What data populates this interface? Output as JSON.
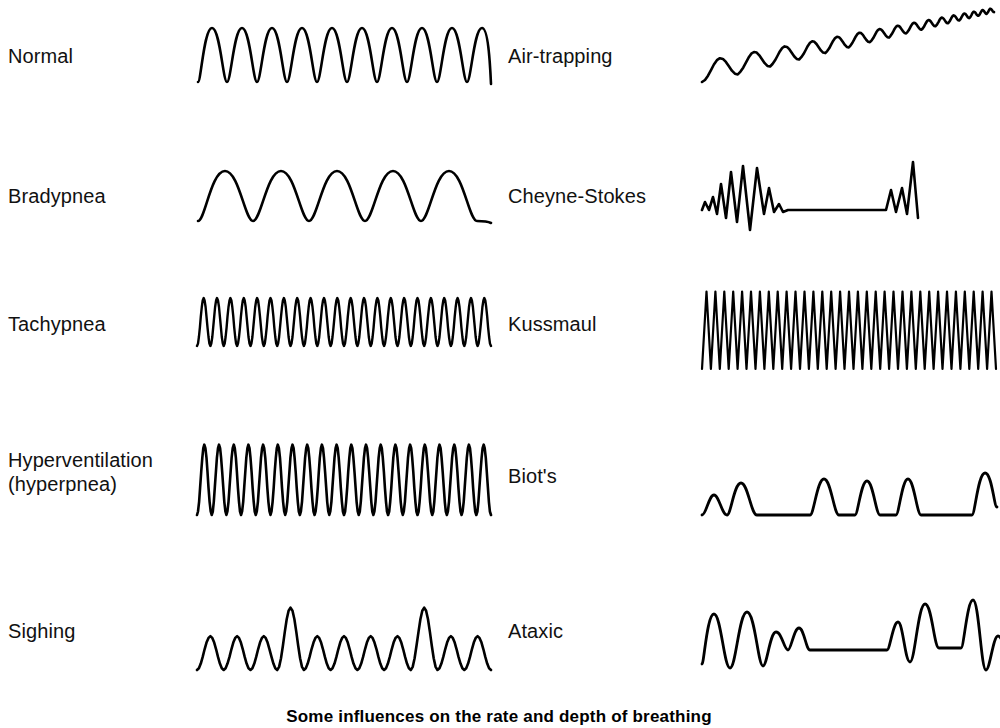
{
  "figure": {
    "caption": "Some influences on the rate and depth of breathing",
    "stroke_color": "#000000",
    "background_color": "#ffffff"
  },
  "columns": [
    {
      "name": "left-column",
      "patterns": [
        {
          "id": "normal",
          "label": "Normal",
          "waveform": "regular-sine",
          "description": "Regular rate and depth",
          "cycles": 10,
          "amplitude": 28,
          "label_lines": 1
        },
        {
          "id": "bradypnea",
          "label": "Bradypnea",
          "waveform": "slow-wide-sine",
          "description": "Slow regular rate, normal depth",
          "cycles": 5,
          "amplitude": 26,
          "label_lines": 1
        },
        {
          "id": "tachypnea",
          "label": "Tachypnea",
          "waveform": "fast-shallow-sine",
          "description": "Rapid regular rate, shallow depth",
          "cycles": 22,
          "amplitude": 24,
          "label_lines": 1
        },
        {
          "id": "hyperventilation",
          "label": "Hyperventilation\n(hyperpnea)",
          "waveform": "fast-deep-sine",
          "description": "Rapid regular rate, increased depth",
          "cycles": 20,
          "amplitude": 38,
          "label_lines": 2
        },
        {
          "id": "sighing",
          "label": "Sighing",
          "waveform": "sine-with-sighs",
          "description": "Regular breaths interrupted by occasional deep sighs",
          "cycles": 11,
          "amplitude": 26,
          "sigh_positions": [
            3,
            8
          ],
          "sigh_amplitude": 48,
          "label_lines": 1
        }
      ]
    },
    {
      "name": "right-column",
      "patterns": [
        {
          "id": "air-trapping",
          "label": "Air-trapping",
          "waveform": "rising-baseline-decaying",
          "description": "Progressively rising baseline with shallower, faster breaths",
          "cycles": 16,
          "amplitude": 16,
          "label_lines": 1
        },
        {
          "id": "cheyne-stokes",
          "label": "Cheyne-Stokes",
          "waveform": "crescendo-decrescendo-apnea",
          "description": "Crescendo-decrescendo breaths alternating with apnea",
          "cycles": 9,
          "amplitude": 46,
          "label_lines": 1
        },
        {
          "id": "kussmaul",
          "label": "Kussmaul",
          "waveform": "very-fast-very-deep",
          "description": "Rapid, very deep, labored breathing",
          "cycles": 33,
          "amplitude": 62,
          "label_lines": 1
        },
        {
          "id": "biots",
          "label": "Biot's",
          "waveform": "clusters-with-apnea",
          "description": "Clusters of breaths separated by irregular apneic periods",
          "cycles": 6,
          "amplitude": 30,
          "label_lines": 1
        },
        {
          "id": "ataxic",
          "label": "Ataxic",
          "waveform": "irregular-with-apnea",
          "description": "Completely irregular rate and depth with apneic periods",
          "cycles": 11,
          "amplitude": 44,
          "label_lines": 1
        }
      ]
    }
  ],
  "layout": {
    "rows_y": [
      55,
      195,
      330,
      480,
      630
    ],
    "left_label_x": 8,
    "right_label_x": 508,
    "left_wave_x": 195,
    "right_wave_x": 700,
    "wave_width": 296
  }
}
